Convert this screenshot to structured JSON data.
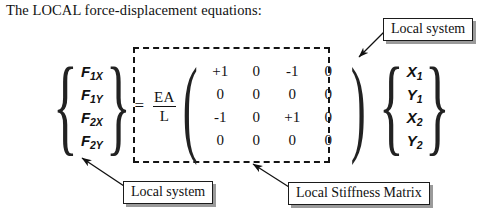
{
  "figure": {
    "title": "The LOCAL force-displacement equations:",
    "equals_sign": "=",
    "scalar": {
      "numerator": "EA",
      "denominator": "L"
    },
    "force_vector": {
      "name": "force-vector",
      "open_brace": "{",
      "close_brace": "}",
      "items": [
        {
          "symbol": "F",
          "subscript": "1X"
        },
        {
          "symbol": "F",
          "subscript": "1Y"
        },
        {
          "symbol": "F",
          "subscript": "2X"
        },
        {
          "symbol": "F",
          "subscript": "2Y"
        }
      ]
    },
    "displacement_vector": {
      "name": "displacement-vector",
      "open_brace": "{",
      "close_brace": "}",
      "items": [
        {
          "symbol": "X",
          "subscript": "1"
        },
        {
          "symbol": "Y",
          "subscript": "1"
        },
        {
          "symbol": "X",
          "subscript": "2"
        },
        {
          "symbol": "Y",
          "subscript": "2"
        }
      ]
    },
    "stiffness_matrix": {
      "open_paren": "(",
      "close_paren": ")",
      "rows": [
        [
          "+1",
          "0",
          "-1",
          "0"
        ],
        [
          "0",
          "0",
          "0",
          "0"
        ],
        [
          "-1",
          "0",
          "+1",
          "0"
        ],
        [
          "0",
          "0",
          "0",
          "0"
        ]
      ]
    },
    "callouts": {
      "top_right": "Local system",
      "bottom_left": "Local system",
      "bottom_right": "Local Stiffness Matrix"
    },
    "colors": {
      "text": "#111111",
      "dashed_border": "#141414",
      "callout_border": "#1b1b1b",
      "callout_shadow": "#9a9a9a",
      "background": "#ffffff"
    }
  }
}
